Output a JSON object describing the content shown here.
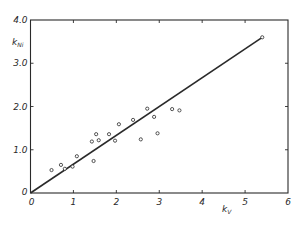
{
  "chart_data": {
    "type": "scatter",
    "title": "",
    "xlabel": "k_V",
    "ylabel": "k_Ni",
    "xlabel_main": "k",
    "xlabel_sub": "V",
    "ylabel_main": "k",
    "ylabel_sub": "Ni",
    "xlim": [
      0,
      6
    ],
    "ylim": [
      0,
      4.0
    ],
    "x_ticks": [
      "0",
      "1",
      "2",
      "3",
      "4",
      "5",
      "6"
    ],
    "y_ticks": [
      "0",
      "1.0",
      "2.0",
      "3.0",
      "4.0"
    ],
    "grid": false,
    "legend": null,
    "series": [
      {
        "name": "measurements",
        "marker": "open-circle",
        "points": [
          {
            "x": 0.49,
            "y": 0.53
          },
          {
            "x": 0.71,
            "y": 0.65
          },
          {
            "x": 0.8,
            "y": 0.56
          },
          {
            "x": 0.98,
            "y": 0.61
          },
          {
            "x": 1.08,
            "y": 0.85
          },
          {
            "x": 1.43,
            "y": 1.19
          },
          {
            "x": 1.47,
            "y": 0.74
          },
          {
            "x": 1.53,
            "y": 1.36
          },
          {
            "x": 1.59,
            "y": 1.22
          },
          {
            "x": 1.83,
            "y": 1.36
          },
          {
            "x": 1.97,
            "y": 1.21
          },
          {
            "x": 2.06,
            "y": 1.59
          },
          {
            "x": 2.39,
            "y": 1.69
          },
          {
            "x": 2.57,
            "y": 1.24
          },
          {
            "x": 2.72,
            "y": 1.95
          },
          {
            "x": 2.88,
            "y": 1.76
          },
          {
            "x": 2.96,
            "y": 1.38
          },
          {
            "x": 3.3,
            "y": 1.94
          },
          {
            "x": 3.47,
            "y": 1.91
          },
          {
            "x": 5.4,
            "y": 3.6
          }
        ]
      },
      {
        "name": "regression line",
        "type": "line",
        "points": [
          {
            "x": 0,
            "y": 0
          },
          {
            "x": 5.4,
            "y": 3.6
          }
        ]
      }
    ]
  },
  "colors": {
    "ink": "#2a2a2a",
    "background": "#ffffff"
  }
}
